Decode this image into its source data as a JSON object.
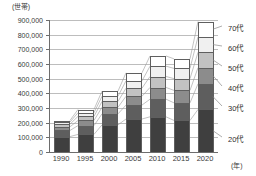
{
  "chart_data": {
    "type": "bar",
    "stacked": true,
    "title": "",
    "subtitle": "",
    "unit_label": "(世帯)",
    "xlabel": "(年)",
    "ylabel": "",
    "categories": [
      "1990",
      "1995",
      "2000",
      "2005",
      "2010",
      "2015",
      "2020"
    ],
    "ylim": [
      0,
      900000
    ],
    "ytick_step": 100000,
    "ytick_labels": [
      "0",
      "100,000",
      "200,000",
      "300,000",
      "400,000",
      "500,000",
      "600,000",
      "700,000",
      "800,000",
      "900,000"
    ],
    "grid": true,
    "legend_position": "right",
    "series": [
      {
        "name": "20代",
        "label": "20代",
        "color": "#3f3f3f",
        "values": [
          105000,
          120000,
          185000,
          225000,
          240000,
          215000,
          290000
        ]
      },
      {
        "name": "30代",
        "label": "30代",
        "color": "#5e5e5e",
        "values": [
          42000,
          60000,
          75000,
          95000,
          120000,
          120000,
          175000
        ]
      },
      {
        "name": "40代",
        "label": "40代",
        "color": "#8c8c8c",
        "values": [
          25000,
          35000,
          45000,
          60000,
          80000,
          85000,
          110000
        ]
      },
      {
        "name": "50代",
        "label": "50代",
        "color": "#c2c2c2",
        "values": [
          18000,
          28000,
          40000,
          55000,
          75000,
          80000,
          105000
        ]
      },
      {
        "name": "60代",
        "label": "60代",
        "color": "#f0f0f0",
        "values": [
          14000,
          25000,
          35000,
          50000,
          70000,
          70000,
          105000
        ]
      },
      {
        "name": "70代",
        "label": "70代",
        "color": "#ffffff",
        "values": [
          11000,
          22000,
          35000,
          55000,
          70000,
          65000,
          105000
        ]
      }
    ],
    "totals": [
      215000,
      290000,
      415000,
      540000,
      655000,
      635000,
      890000
    ]
  },
  "axes": {
    "y_unit": "(世帯)",
    "x_unit": "(年)"
  }
}
